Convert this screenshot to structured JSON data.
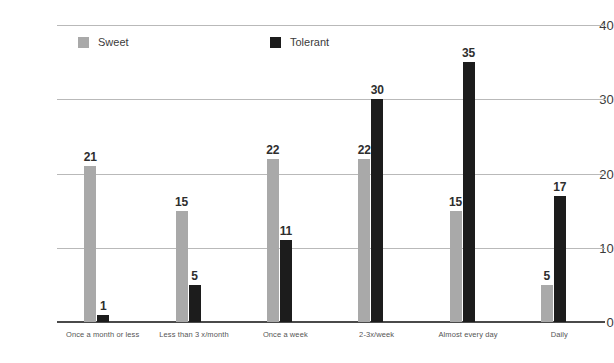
{
  "chart_data": {
    "type": "bar",
    "title": "",
    "xlabel": "",
    "ylabel": "",
    "categories": [
      "Once a month or less",
      "Less than 3 x/month",
      "Once a week",
      "2-3x/week",
      "Almost every day",
      "Daily"
    ],
    "series": [
      {
        "name": "Sweet",
        "color": "#a9a9a9",
        "values": [
          21,
          15,
          22,
          22,
          15,
          5
        ]
      },
      {
        "name": "Tolerant",
        "color": "#1c1c1c",
        "values": [
          1,
          5,
          11,
          30,
          35,
          17
        ]
      }
    ],
    "yticks": [
      0,
      10,
      20,
      30,
      40
    ],
    "ytick_labels": [
      "0",
      "10",
      "20",
      "30",
      "40"
    ],
    "ylim": [
      0,
      40
    ],
    "grid": true,
    "legend_position": "top-inside"
  },
  "legend": {
    "entries": [
      {
        "label": "Sweet",
        "color": "#a9a9a9"
      },
      {
        "label": "Tolerant",
        "color": "#1c1c1c"
      }
    ]
  },
  "colors": {
    "sweet": "#a9a9a9",
    "tolerant": "#1c1c1c",
    "gridline": "#b9b9b9",
    "axis": "#4a4a4a",
    "tick_text": "#3b3b3b",
    "category_text": "#555555",
    "value_text": "#2e2e2e",
    "background": "#ffffff"
  }
}
